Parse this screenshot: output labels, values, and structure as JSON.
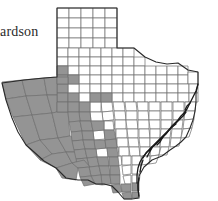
{
  "figure": {
    "kind": "choropleth-county-map",
    "region": "Texas",
    "partial_label": "ardson",
    "width_px": 218,
    "height_px": 201,
    "background_color": "#ffffff"
  },
  "legend": {
    "shaded_color": "#949494",
    "unshaded_color": "#ffffff",
    "county_border_color": "#6f6f6f",
    "state_border_color": "#2a2a2a",
    "shaded_meaning": "county present / recorded",
    "unshaded_meaning": "county absent / not recorded"
  },
  "chart_data": {
    "type": "heatmap",
    "title": "",
    "xlabel": "",
    "ylabel": "",
    "categories": [
      "shaded",
      "unshaded"
    ],
    "values": [
      74,
      180
    ],
    "regions": [
      {
        "name": "Trans-Pecos / Big Bend",
        "state": "shaded"
      },
      {
        "name": "West Texas / Llano Estacado southern edge",
        "state": "shaded"
      },
      {
        "name": "Edwards Plateau",
        "state": "shaded"
      },
      {
        "name": "South Texas Plains",
        "state": "shaded"
      },
      {
        "name": "Rio Grande Valley",
        "state": "shaded"
      },
      {
        "name": "Panhandle",
        "state": "unshaded"
      },
      {
        "name": "North Central Texas",
        "state": "unshaded"
      },
      {
        "name": "East Texas / Piney Woods",
        "state": "unshaded"
      },
      {
        "name": "Upper Gulf Coast",
        "state": "unshaded"
      }
    ]
  }
}
